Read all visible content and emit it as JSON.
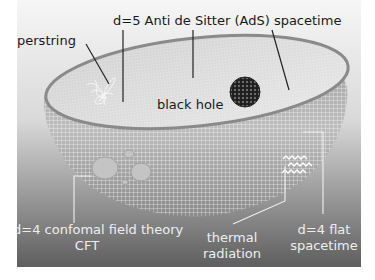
{
  "diagram": {
    "labels": {
      "ads_spacetime": "d=5 Anti de Sitter (AdS) spacetime",
      "superstring": "superstring",
      "black_hole": "black hole",
      "cft_line1": "d=4 confomal field theory",
      "cft_line2": "CFT",
      "thermal_line1": "thermal",
      "thermal_line2": "radiation",
      "flat_line1": "d=4 flat",
      "flat_line2": "spacetime"
    },
    "colors": {
      "background_top": "#f4f4f4",
      "background_bottom": "#5e5e5e",
      "bowl_grid": "#ffffff",
      "bowl_rim": "#8c8c8c",
      "leader_dark": "#222222",
      "leader_light": "#f0f0f0"
    }
  }
}
